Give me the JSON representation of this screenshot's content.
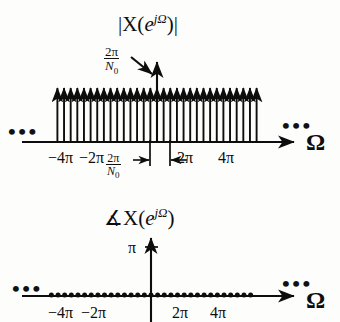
{
  "figure": {
    "width": 340,
    "height": 322,
    "background": "#fdfdfc",
    "ink": "#0d0d0d"
  },
  "magnitude_plot": {
    "title_prefix": "|X(",
    "title_base": "e",
    "title_exponent": "jΩ",
    "title_suffix": ")|",
    "axis_label": "Ω",
    "annotation": {
      "numerator": "2π",
      "denominator": "N",
      "denominator_sub": "0",
      "arrow": "diagonal-arrow-down-right"
    },
    "spacing_marker": {
      "numerator": "2π",
      "denominator": "N",
      "denominator_sub": "0",
      "left_arrow": "→",
      "right_arrow": "←"
    },
    "ellipsis_left": "•••",
    "ellipsis_right": "•••",
    "tick_labels": [
      "−4π",
      "−2π",
      "2π",
      "4π"
    ]
  },
  "phase_plot": {
    "title_prefix": "∡X(",
    "title_base": "e",
    "title_exponent": "jΩ",
    "title_suffix": ")",
    "axis_label": "Ω",
    "y_tick_label": "π",
    "ellipsis_left": "•••",
    "ellipsis_right": "•••",
    "tick_labels": [
      "−4π",
      "−2π",
      "2π",
      "4π"
    ]
  },
  "chart_data": {
    "type": "line",
    "panels": [
      {
        "name": "magnitude",
        "title": "|X(e^{jΩ})|",
        "type": "impulse-train",
        "xlabel": "Ω",
        "ylabel": "",
        "xaxis": {
          "ticks": [
            -4,
            -2,
            2,
            4
          ],
          "tick_labels": [
            "−4π",
            "−2π",
            "2π",
            "4π"
          ],
          "unit": "π",
          "range_visible": [
            -6.2,
            6.2
          ],
          "extends_with_ellipsis": true
        },
        "yaxis": {
          "arrow": true,
          "impulse_height_label": "2π/N_0",
          "grid": false
        },
        "impulses": {
          "count": 31,
          "spacing_label": "2π/N_0",
          "spacing_value_pi": 0.4,
          "equal_heights": true,
          "height_annotation": "2π/N_0",
          "x_positions_pi": [
            -6.0,
            -5.6,
            -5.2,
            -4.8,
            -4.4,
            -4.0,
            -3.6,
            -3.2,
            -2.8,
            -2.4,
            -2.0,
            -1.6,
            -1.2,
            -0.8,
            -0.4,
            0.0,
            0.4,
            0.8,
            1.2,
            1.6,
            2.0,
            2.4,
            2.8,
            3.2,
            3.6,
            4.0,
            4.4,
            4.8,
            5.2,
            5.6,
            6.0
          ],
          "values": [
            1,
            1,
            1,
            1,
            1,
            1,
            1,
            1,
            1,
            1,
            1,
            1,
            1,
            1,
            1,
            1,
            1,
            1,
            1,
            1,
            1,
            1,
            1,
            1,
            1,
            1,
            1,
            1,
            1,
            1,
            1
          ]
        }
      },
      {
        "name": "phase",
        "title": "∡X(e^{jΩ})",
        "type": "scatter",
        "xlabel": "Ω",
        "ylabel": "",
        "xaxis": {
          "ticks": [
            -4,
            -2,
            2,
            4
          ],
          "tick_labels": [
            "−4π",
            "−2π",
            "2π",
            "4π"
          ],
          "unit": "π",
          "range_visible": [
            -6.2,
            6.2
          ],
          "extends_with_ellipsis": true
        },
        "yaxis": {
          "ticks": [
            3.14159
          ],
          "tick_labels": [
            "π"
          ],
          "arrow": true,
          "grid": false
        },
        "points": {
          "count": 31,
          "x_positions_pi": [
            -6.0,
            -5.6,
            -5.2,
            -4.8,
            -4.4,
            -4.0,
            -3.6,
            -3.2,
            -2.8,
            -2.4,
            -2.0,
            -1.6,
            -1.2,
            -0.8,
            -0.4,
            0.0,
            0.4,
            0.8,
            1.2,
            1.6,
            2.0,
            2.4,
            2.8,
            3.2,
            3.6,
            4.0,
            4.4,
            4.8,
            5.2,
            5.6,
            6.0
          ],
          "values": [
            0,
            0,
            0,
            0,
            0,
            0,
            0,
            0,
            0,
            0,
            0,
            0,
            0,
            0,
            0,
            0,
            0,
            0,
            0,
            0,
            0,
            0,
            0,
            0,
            0,
            0,
            0,
            0,
            0,
            0,
            0
          ]
        }
      }
    ]
  }
}
